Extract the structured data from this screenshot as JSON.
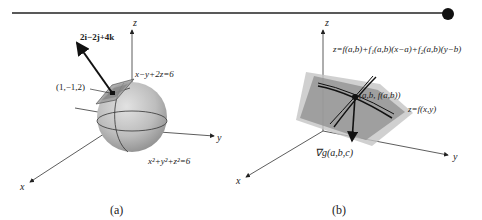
{
  "figure": {
    "panel_a": {
      "caption": "(a)",
      "axes": {
        "x": "x",
        "y": "y",
        "z": "z"
      },
      "vector_label": "2i−2j+4k",
      "point_label": "(1,−1,2)",
      "plane_label": "x−y+2z=6",
      "surface_label": "x²+y²+z²=6"
    },
    "panel_b": {
      "caption": "(b)",
      "axes": {
        "x": "x",
        "y": "y",
        "z": "z"
      },
      "tangent_plane_label": "z=f(a,b)+f₁(a,b)(x−a)+f₂(a,b)(y−b)",
      "point_label": "(a,b, f(a,b))",
      "surface_label": "z=f(x,y)",
      "gradient_label": "∇g(a,b,c)"
    },
    "colors": {
      "sphere_fill": "#bdbdbd",
      "plane_fill": "#a8a8a8",
      "surface_fill": "#8f8f8f",
      "lines": "#222222"
    }
  }
}
